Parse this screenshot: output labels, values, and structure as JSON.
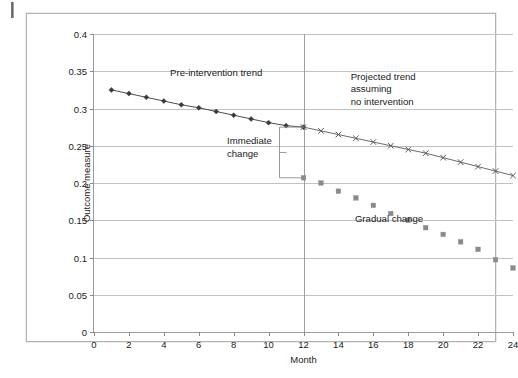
{
  "chart_data": {
    "type": "line",
    "title": "",
    "xlabel": "Month",
    "ylabel": "Outcome measure",
    "xlim": [
      0,
      24
    ],
    "ylim": [
      0,
      0.4
    ],
    "xticks": [
      0,
      2,
      4,
      6,
      8,
      10,
      12,
      14,
      16,
      18,
      20,
      22,
      24
    ],
    "xtick_labels": [
      "0",
      "2",
      "4",
      "6",
      "8",
      "10",
      "12",
      "14",
      "16",
      "18",
      "20",
      "22",
      "24"
    ],
    "yticks": [
      0,
      0.05,
      0.1,
      0.15,
      0.2,
      0.25,
      0.3,
      0.35,
      0.4
    ],
    "ytick_labels": [
      "0",
      "0.05",
      "0.1",
      "0.15",
      "0.2",
      "0.25",
      "0.3",
      "0.35",
      "0.4"
    ],
    "grid": "horizontal",
    "legend": "none",
    "series": [
      {
        "name": "Pre-intervention trend",
        "marker": "diamond",
        "line": true,
        "color": "#3a3a3a",
        "x": [
          1,
          2,
          3,
          4,
          5,
          6,
          7,
          8,
          9,
          10,
          11,
          12
        ],
        "values": [
          0.325,
          0.32,
          0.315,
          0.31,
          0.305,
          0.301,
          0.296,
          0.291,
          0.286,
          0.281,
          0.277,
          0.275
        ]
      },
      {
        "name": "Projected trend assuming no intervention",
        "marker": "cross",
        "line": true,
        "color": "#5a5a5a",
        "x": [
          12,
          13,
          14,
          15,
          16,
          17,
          18,
          19,
          20,
          21,
          22,
          23,
          24
        ],
        "values": [
          0.275,
          0.27,
          0.265,
          0.26,
          0.255,
          0.25,
          0.245,
          0.24,
          0.234,
          0.228,
          0.222,
          0.216,
          0.21
        ]
      },
      {
        "name": "Gradual change",
        "marker": "square",
        "line": false,
        "color": "#8a8a8a",
        "x": [
          12,
          13,
          14,
          15,
          16,
          17,
          18,
          19,
          20,
          21,
          22,
          23,
          24
        ],
        "values": [
          0.207,
          0.2,
          0.189,
          0.18,
          0.17,
          0.159,
          0.15,
          0.14,
          0.131,
          0.121,
          0.111,
          0.097,
          0.086
        ]
      }
    ],
    "annotations": [
      {
        "name": "pre-intervention-trend-label",
        "text": "Pre-intervention trend",
        "x": 7.0,
        "y": 0.348
      },
      {
        "name": "projected-trend-label",
        "text": "Projected trend assuming\nno intervention",
        "x": 17.8,
        "y": 0.325
      },
      {
        "name": "immediate-change-label",
        "text": "Immediate\nchange",
        "x": 8.9,
        "y": 0.248
      },
      {
        "name": "gradual-change-label",
        "text": "Gradual change",
        "x": 16.9,
        "y": 0.152
      }
    ],
    "markers": {
      "intervention_line": {
        "name": "intervention-vertical-line",
        "x": 12,
        "y_from": 0.0,
        "y_to": 0.4
      },
      "immediate_change_bracket": {
        "name": "immediate-change-bracket",
        "x": 12,
        "y_top": 0.275,
        "y_bottom": 0.207
      }
    },
    "colors": {
      "frame": "#b3b3b3",
      "axis": "#9a9a9a",
      "grid": "#c2c2c2",
      "pre_intervention": "#3a3a3a",
      "projected": "#5a5a5a",
      "gradual": "#8a8a8a",
      "text": "#1a1a1a",
      "background": "#ffffff"
    }
  }
}
